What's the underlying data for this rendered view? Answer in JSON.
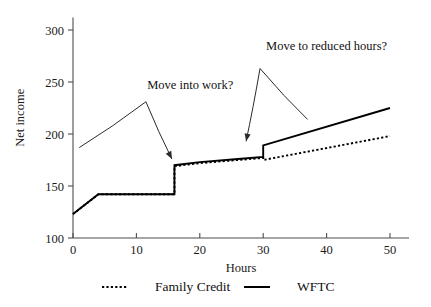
{
  "chart_data": {
    "type": "line",
    "title": "",
    "xlabel": "Hours",
    "ylabel": "Net income",
    "xlim": [
      0,
      53
    ],
    "ylim": [
      100,
      310
    ],
    "xticks": [
      "0",
      "10",
      "20",
      "30",
      "40",
      "50"
    ],
    "xtick_values": [
      0,
      10,
      20,
      30,
      40,
      50
    ],
    "yticks": [
      "100",
      "150",
      "200",
      "250",
      "300"
    ],
    "ytick_values": [
      100,
      150,
      200,
      250,
      300
    ],
    "grid": false,
    "legend_position": "bottom",
    "series": [
      {
        "name": "Family Credit",
        "style": "dotted",
        "points": [
          [
            0,
            123
          ],
          [
            4,
            142
          ],
          [
            16,
            142
          ],
          [
            16,
            169
          ],
          [
            20,
            172
          ],
          [
            26,
            175
          ],
          [
            30,
            177
          ],
          [
            30,
            175
          ],
          [
            50,
            198
          ]
        ]
      },
      {
        "name": "WFTC",
        "style": "solid",
        "points": [
          [
            0,
            123
          ],
          [
            4,
            142
          ],
          [
            16,
            142
          ],
          [
            16,
            170
          ],
          [
            20,
            173
          ],
          [
            26,
            176
          ],
          [
            30,
            178
          ],
          [
            30,
            189
          ],
          [
            50,
            225
          ]
        ]
      }
    ],
    "annotations": [
      {
        "id": "move-into-work",
        "text": "Move into work?",
        "text_x": 18.5,
        "text_y": 243,
        "arrow_from": [
          1.0,
          187
        ],
        "arrow_peak": [
          11.5,
          231
        ],
        "arrow_to": [
          15.6,
          176
        ]
      },
      {
        "id": "move-to-reduced-hours",
        "text": "Move to reduced hours?",
        "text_x": 40.0,
        "text_y": 281,
        "arrow_from": [
          37.0,
          214
        ],
        "arrow_peak": [
          29.5,
          263
        ],
        "arrow_to": [
          27.3,
          193
        ]
      }
    ]
  },
  "legend": {
    "items": [
      {
        "label": "Family Credit",
        "style": "dotted"
      },
      {
        "label": "WFTC",
        "style": "solid"
      }
    ]
  },
  "colors": {
    "series": "#000000",
    "axis": "#4d4d4d",
    "annotation": "#2b2b2b",
    "background": "#ffffff"
  }
}
